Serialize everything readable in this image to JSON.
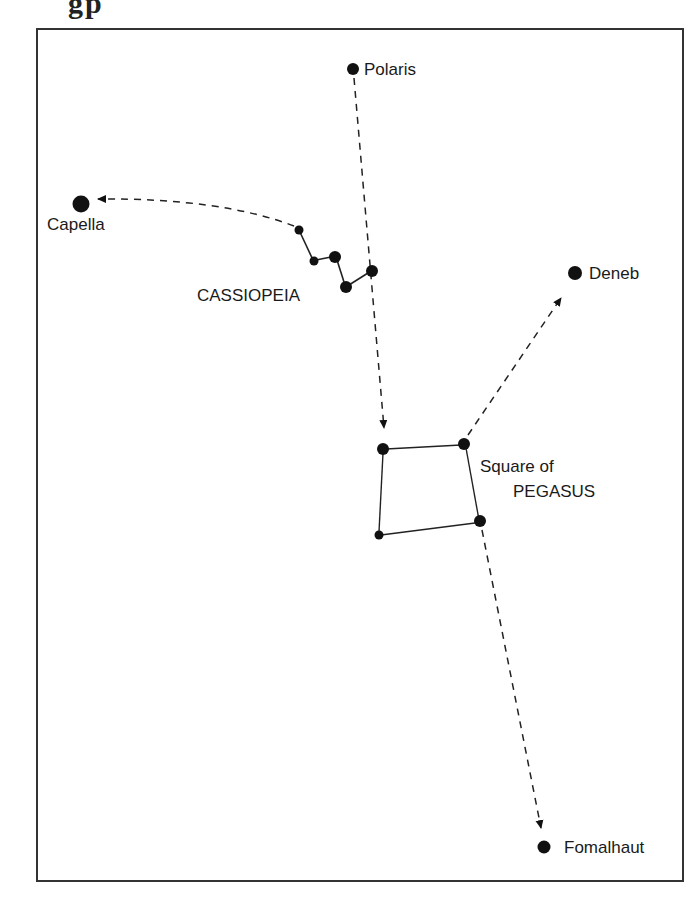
{
  "title_fragment": "gp",
  "labels": {
    "polaris": "Polaris",
    "capella": "Capella",
    "cassiopeia": "CASSIOPEIA",
    "deneb": "Deneb",
    "square_line1": "Square of",
    "square_line2": "PEGASUS",
    "fomalhaut": "Fomalhaut"
  },
  "stars": [
    {
      "name": "Polaris",
      "magnitude_class": "medium"
    },
    {
      "name": "Capella",
      "magnitude_class": "large"
    },
    {
      "name": "Cassiopeia-1",
      "magnitude_class": "small"
    },
    {
      "name": "Cassiopeia-2",
      "magnitude_class": "small"
    },
    {
      "name": "Cassiopeia-3",
      "magnitude_class": "medium"
    },
    {
      "name": "Cassiopeia-4",
      "magnitude_class": "medium"
    },
    {
      "name": "Cassiopeia-5",
      "magnitude_class": "medium"
    },
    {
      "name": "Deneb",
      "magnitude_class": "medium"
    },
    {
      "name": "Pegasus-NW",
      "magnitude_class": "medium"
    },
    {
      "name": "Pegasus-NE",
      "magnitude_class": "medium"
    },
    {
      "name": "Pegasus-SE",
      "magnitude_class": "medium"
    },
    {
      "name": "Pegasus-SW",
      "magnitude_class": "small"
    },
    {
      "name": "Fomalhaut",
      "magnitude_class": "medium"
    }
  ],
  "pointers": [
    {
      "from": "Cassiopeia-1",
      "to": "Capella"
    },
    {
      "from": "Polaris",
      "to": "Pegasus-NW",
      "via": "Cassiopeia-5"
    },
    {
      "from": "Pegasus-NE",
      "to": "Deneb"
    },
    {
      "from": "Pegasus-SE",
      "to": "Fomalhaut"
    }
  ],
  "colors": {
    "ink": "#111111",
    "frame": "#333333",
    "background": "#ffffff"
  }
}
